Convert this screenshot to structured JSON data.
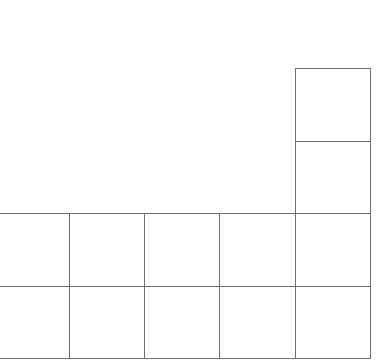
{
  "diagram": {
    "type": "grid-shape",
    "line_color": "#6e6e6e",
    "background": "#ffffff",
    "cells": [
      {
        "id": "r0c4",
        "row": 0,
        "col": 4,
        "x": 295,
        "y": 68,
        "w": 76,
        "h": 74
      },
      {
        "id": "r1c4",
        "row": 1,
        "col": 4,
        "x": 295,
        "y": 141,
        "w": 76,
        "h": 73
      },
      {
        "id": "r2c0",
        "row": 2,
        "col": 0,
        "x": -1,
        "y": 213,
        "w": 71,
        "h": 74
      },
      {
        "id": "r2c1",
        "row": 2,
        "col": 1,
        "x": 69,
        "y": 213,
        "w": 76,
        "h": 74
      },
      {
        "id": "r2c2",
        "row": 2,
        "col": 2,
        "x": 144,
        "y": 213,
        "w": 76,
        "h": 74
      },
      {
        "id": "r2c3",
        "row": 2,
        "col": 3,
        "x": 219,
        "y": 213,
        "w": 77,
        "h": 74
      },
      {
        "id": "r2c4",
        "row": 2,
        "col": 4,
        "x": 295,
        "y": 213,
        "w": 76,
        "h": 74
      },
      {
        "id": "r3c0",
        "row": 3,
        "col": 0,
        "x": -1,
        "y": 286,
        "w": 71,
        "h": 73
      },
      {
        "id": "r3c1",
        "row": 3,
        "col": 1,
        "x": 69,
        "y": 286,
        "w": 76,
        "h": 73
      },
      {
        "id": "r3c2",
        "row": 3,
        "col": 2,
        "x": 144,
        "y": 286,
        "w": 76,
        "h": 73
      },
      {
        "id": "r3c3",
        "row": 3,
        "col": 3,
        "x": 219,
        "y": 286,
        "w": 77,
        "h": 73
      },
      {
        "id": "r3c4",
        "row": 3,
        "col": 4,
        "x": 295,
        "y": 286,
        "w": 76,
        "h": 73
      }
    ]
  }
}
